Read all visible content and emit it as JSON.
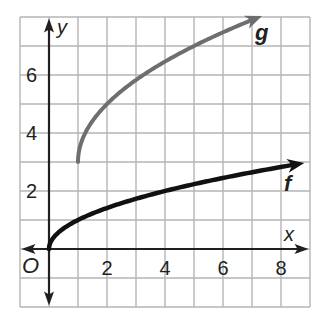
{
  "chart_data": {
    "type": "line",
    "title": "",
    "xlabel": "x",
    "ylabel": "y",
    "origin_label": "O",
    "xlim": [
      -1,
      9
    ],
    "ylim": [
      -2,
      8
    ],
    "grid": true,
    "grid_step": 1,
    "x_ticks": [
      2,
      4,
      6,
      8
    ],
    "y_ticks": [
      2,
      4,
      6
    ],
    "tick_labels": {
      "x": [
        "2",
        "4",
        "6",
        "8"
      ],
      "y": [
        "2",
        "4",
        "6"
      ]
    },
    "series": [
      {
        "name": "f",
        "label": "f",
        "formula": "sqrt(x)",
        "color": "#111111",
        "x_start": 0,
        "x_end": 8.7,
        "points": [
          [
            0,
            0
          ],
          [
            0.25,
            0.5
          ],
          [
            1,
            1
          ],
          [
            2,
            1.41
          ],
          [
            4,
            2
          ],
          [
            6,
            2.45
          ],
          [
            8,
            2.83
          ],
          [
            8.7,
            2.95
          ]
        ]
      },
      {
        "name": "g",
        "label": "g",
        "formula": "2*sqrt(x-1)+3",
        "color": "#6d6e71",
        "x_start": 1,
        "x_end": 7.25,
        "points": [
          [
            1,
            3
          ],
          [
            1.25,
            4
          ],
          [
            2,
            5
          ],
          [
            3,
            5.83
          ],
          [
            4,
            6.46
          ],
          [
            5,
            7
          ],
          [
            6,
            7.47
          ],
          [
            7.25,
            8
          ]
        ]
      }
    ],
    "legend": {
      "position": "inline-labels"
    }
  },
  "colors": {
    "grid": "#b5b5b5",
    "axis": "#231f20",
    "f": "#111111",
    "g": "#6d6e71"
  }
}
